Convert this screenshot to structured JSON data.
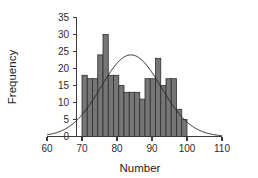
{
  "chart_data": {
    "type": "bar",
    "title": "",
    "subtitle": "",
    "xlabel": "Number",
    "ylabel": "Frequency",
    "xlim": [
      60,
      110
    ],
    "ylim": [
      0,
      35
    ],
    "xticks": [
      60,
      70,
      80,
      90,
      100,
      110
    ],
    "yticks": [
      0,
      5,
      10,
      15,
      20,
      25,
      30,
      35
    ],
    "grid": false,
    "legend": null,
    "bin_width": 1.5,
    "bin_start": 70,
    "bin_end": 100,
    "categories": [
      "70.0-71.5",
      "71.5-73.0",
      "73.0-74.5",
      "74.5-76.0",
      "76.0-77.5",
      "77.5-79.0",
      "79.0-80.5",
      "80.5-82.0",
      "82.0-83.5",
      "83.5-85.0",
      "85.0-86.5",
      "86.5-88.0",
      "88.0-89.5",
      "89.5-91.0",
      "91.0-92.5",
      "92.5-94.0",
      "94.0-95.5",
      "95.5-97.0",
      "97.0-98.5",
      "98.5-100.0"
    ],
    "values": [
      18,
      17,
      17,
      24,
      30,
      18,
      18,
      15,
      13,
      13,
      13,
      11,
      17,
      17,
      23,
      15,
      17,
      17,
      8,
      5
    ],
    "bar_color": "#767676",
    "bar_edge_color": "#2d2d2d",
    "overlay": {
      "type": "line",
      "name": "normal-curve",
      "mean": 84,
      "peak_value": 24,
      "std_dev": 8.6,
      "color": "#2b2b2b",
      "x_range": [
        60,
        110
      ]
    }
  },
  "axes": {
    "y_axis_label": "Frequency",
    "x_axis_label": "Number"
  }
}
